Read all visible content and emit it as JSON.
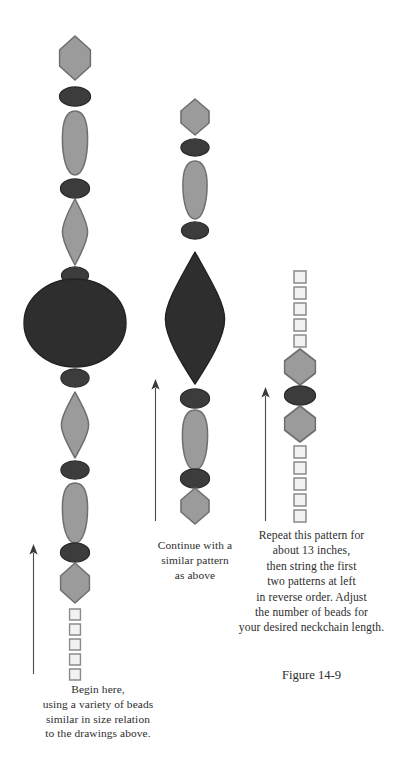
{
  "figure": {
    "label": "Figure 14-9",
    "colors": {
      "light_bead_fill": "#9b9b9b",
      "light_bead_stroke": "#6f6f6f",
      "dark_bead_fill": "#3c3c3c",
      "dark_bead_stroke": "#2a2a2a",
      "big_dark_fill": "#2e2e2e",
      "square_bead_fill": "#f2f2f2",
      "square_bead_stroke": "#8a8a8a",
      "arrow_color": "#4a4a4a",
      "text_color": "#2d2d2d",
      "background": "#ffffff"
    },
    "strands": [
      {
        "name": "left-strand",
        "center_x": 75,
        "beads": [
          {
            "shape": "hexagon",
            "tone": "light",
            "cy": 58,
            "w": 33,
            "h": 46
          },
          {
            "shape": "ellipse",
            "tone": "dark",
            "cy": 96,
            "w": 33,
            "h": 21
          },
          {
            "shape": "teardrop",
            "tone": "light",
            "cy": 143,
            "w": 28,
            "h": 66
          },
          {
            "shape": "ellipse",
            "tone": "dark",
            "cy": 188,
            "w": 31,
            "h": 21
          },
          {
            "shape": "lens",
            "tone": "light",
            "cy": 232,
            "w": 28,
            "h": 68
          },
          {
            "shape": "ellipse",
            "tone": "dark",
            "cy": 275,
            "w": 29,
            "h": 19
          },
          {
            "shape": "circle",
            "tone": "big",
            "cy": 323,
            "w": 104,
            "h": 90
          },
          {
            "shape": "ellipse",
            "tone": "dark",
            "cy": 378,
            "w": 30,
            "h": 20
          },
          {
            "shape": "lens",
            "tone": "light",
            "cy": 425,
            "w": 30,
            "h": 68
          },
          {
            "shape": "ellipse",
            "tone": "dark",
            "cy": 470,
            "w": 30,
            "h": 20
          },
          {
            "shape": "teardrop",
            "tone": "light",
            "cy": 513,
            "w": 28,
            "h": 62
          },
          {
            "shape": "ellipse",
            "tone": "dark",
            "cy": 552,
            "w": 31,
            "h": 21
          },
          {
            "shape": "hexagon",
            "tone": "light",
            "cy": 583,
            "w": 31,
            "h": 42
          },
          {
            "shape": "square",
            "tone": "outline",
            "cy": 614,
            "w": 13,
            "h": 13
          },
          {
            "shape": "square",
            "tone": "outline",
            "cy": 629,
            "w": 13,
            "h": 13
          },
          {
            "shape": "square",
            "tone": "outline",
            "cy": 644,
            "w": 13,
            "h": 13
          },
          {
            "shape": "square",
            "tone": "outline",
            "cy": 659,
            "w": 13,
            "h": 13
          },
          {
            "shape": "square",
            "tone": "outline",
            "cy": 674,
            "w": 13,
            "h": 13
          }
        ],
        "arrow": {
          "x": 33,
          "top": 545,
          "bottom": 673
        },
        "caption": [
          "Begin here,",
          "using a variety of beads",
          "similar in size relation",
          "to the drawings above."
        ]
      },
      {
        "name": "middle-strand",
        "center_x": 195,
        "beads": [
          {
            "shape": "hexagon",
            "tone": "light",
            "cy": 117,
            "w": 30,
            "h": 38
          },
          {
            "shape": "ellipse",
            "tone": "dark",
            "cy": 147,
            "w": 30,
            "h": 19
          },
          {
            "shape": "teardrop",
            "tone": "light",
            "cy": 190,
            "w": 27,
            "h": 60
          },
          {
            "shape": "ellipse",
            "tone": "dark",
            "cy": 230,
            "w": 29,
            "h": 19
          },
          {
            "shape": "lens",
            "tone": "big",
            "cy": 318,
            "w": 62,
            "h": 134
          },
          {
            "shape": "ellipse",
            "tone": "dark",
            "cy": 398,
            "w": 31,
            "h": 21
          },
          {
            "shape": "teardrop",
            "tone": "light",
            "cy": 440,
            "w": 28,
            "h": 62
          },
          {
            "shape": "ellipse",
            "tone": "dark",
            "cy": 478,
            "w": 31,
            "h": 21
          },
          {
            "shape": "hexagon",
            "tone": "light",
            "cy": 506,
            "w": 30,
            "h": 38
          }
        ],
        "arrow": {
          "x": 155,
          "top": 380,
          "bottom": 520
        },
        "caption": [
          "Continue with a",
          "similar pattern",
          "as above"
        ]
      },
      {
        "name": "right-strand",
        "center_x": 300,
        "beads": [
          {
            "shape": "square",
            "tone": "outline",
            "cy": 277,
            "w": 14,
            "h": 14
          },
          {
            "shape": "square",
            "tone": "outline",
            "cy": 293,
            "w": 14,
            "h": 14
          },
          {
            "shape": "square",
            "tone": "outline",
            "cy": 309,
            "w": 14,
            "h": 14
          },
          {
            "shape": "square",
            "tone": "outline",
            "cy": 325,
            "w": 14,
            "h": 14
          },
          {
            "shape": "square",
            "tone": "outline",
            "cy": 341,
            "w": 14,
            "h": 14
          },
          {
            "shape": "hexagon",
            "tone": "light",
            "cy": 367,
            "w": 33,
            "h": 38
          },
          {
            "shape": "ellipse",
            "tone": "dark",
            "cy": 395,
            "w": 33,
            "h": 21
          },
          {
            "shape": "hexagon",
            "tone": "light",
            "cy": 424,
            "w": 33,
            "h": 38
          },
          {
            "shape": "square",
            "tone": "outline",
            "cy": 452,
            "w": 14,
            "h": 14
          },
          {
            "shape": "square",
            "tone": "outline",
            "cy": 468,
            "w": 14,
            "h": 14
          },
          {
            "shape": "square",
            "tone": "outline",
            "cy": 484,
            "w": 14,
            "h": 14
          },
          {
            "shape": "square",
            "tone": "outline",
            "cy": 500,
            "w": 14,
            "h": 14
          },
          {
            "shape": "square",
            "tone": "outline",
            "cy": 516,
            "w": 14,
            "h": 14
          }
        ],
        "arrow": {
          "x": 265,
          "top": 388,
          "bottom": 520
        },
        "caption": [
          "Repeat this pattern for",
          "about 13 inches,",
          "then string the first",
          "two patterns at left",
          "in reverse order. Adjust",
          "the number of beads for",
          "your desired neckchain length."
        ]
      }
    ]
  }
}
